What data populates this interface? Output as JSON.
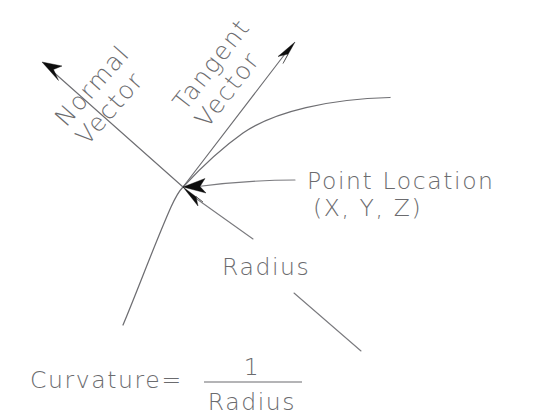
{
  "diagram": {
    "background_color": "#ffffff",
    "line_color": "#6e6e72",
    "text_color": "#6b6b6e",
    "arrow_color": "#0d0d0d",
    "labels": {
      "normal_vector_line1": "Normal",
      "normal_vector_line2": "Vector",
      "tangent_vector_line1": "Tangent",
      "tangent_vector_line2": "Vector",
      "point_location_line1": "Point Location",
      "point_location_line2": "(X, Y, Z)",
      "radius": "Radius",
      "curvature_lhs": "Curvature=",
      "curvature_numerator": "1",
      "curvature_denominator": "Radius"
    },
    "geometry": {
      "point_x": 183,
      "point_y": 187,
      "normal_tip_x": 42,
      "normal_tip_y": 62,
      "tangent_tip_x": 295,
      "tangent_tip_y": 42,
      "curve_right_end_x": 390,
      "curve_right_end_y": 98,
      "curve_left_end_x": 123,
      "curve_left_end_y": 325
    }
  }
}
